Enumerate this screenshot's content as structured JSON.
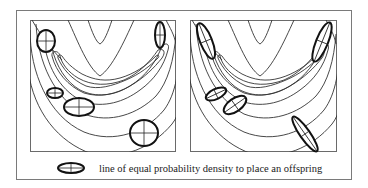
{
  "figure": {
    "legend": {
      "icon": "ellipse-with-crosshair-icon",
      "label": "line of equal probability density to place an offspring"
    },
    "panels": [
      {
        "id": "left",
        "description": "isotropic offspring distributions (axis-aligned ellipses) on banana-shaped contour landscape",
        "ellipses": [
          {
            "cx": 46,
            "cy": 41,
            "rx": 9,
            "ry": 11,
            "rot": 0
          },
          {
            "cx": 160,
            "cy": 35,
            "rx": 5,
            "ry": 13,
            "rot": 0
          },
          {
            "cx": 55,
            "cy": 93,
            "rx": 8,
            "ry": 5,
            "rot": 0
          },
          {
            "cx": 79,
            "cy": 107,
            "rx": 15,
            "ry": 9,
            "rot": 0
          },
          {
            "cx": 144,
            "cy": 133,
            "rx": 14,
            "ry": 13,
            "rot": 0
          }
        ]
      },
      {
        "id": "right",
        "description": "rotated/correlated offspring distributions aligned with contour landscape",
        "ellipses": [
          {
            "cx": 206,
            "cy": 41,
            "rx": 6,
            "ry": 19,
            "rot": -22
          },
          {
            "cx": 322,
            "cy": 42,
            "rx": 6,
            "ry": 21,
            "rot": 22
          },
          {
            "cx": 216,
            "cy": 94,
            "rx": 11,
            "ry": 5,
            "rot": -25
          },
          {
            "cx": 235,
            "cy": 105,
            "rx": 13,
            "ry": 6.5,
            "rot": -35
          },
          {
            "cx": 305,
            "cy": 134,
            "rx": 21,
            "ry": 5,
            "rot": 55
          }
        ]
      }
    ]
  }
}
